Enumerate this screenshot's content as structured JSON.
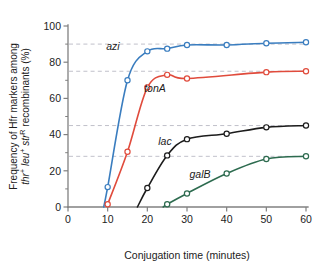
{
  "figure": {
    "background_color": "#ffffff",
    "plot_area": {
      "left": 68,
      "right": 306,
      "top": 26,
      "bottom": 207
    }
  },
  "axes": {
    "x": {
      "title": "Conjugation time (minutes)",
      "ticks": [
        "0",
        "10",
        "20",
        "30",
        "40",
        "50",
        "60"
      ],
      "tick_values": [
        0,
        10,
        20,
        30,
        40,
        50,
        60
      ],
      "min": 0,
      "max": 60
    },
    "y": {
      "title_line1": "Frequency of Hfr markers among",
      "title_line2_parts": [
        {
          "text": "thr",
          "italic": true
        },
        {
          "text": "+",
          "sup": true
        },
        {
          "text": " leu",
          "italic": true
        },
        {
          "text": "+",
          "sup": true
        },
        {
          "text": " str",
          "italic": true
        },
        {
          "text": "R",
          "sup": true
        },
        {
          "text": " recombinants (%)",
          "italic": false
        }
      ],
      "ticks": [
        "0",
        "20",
        "40",
        "60",
        "80",
        "100"
      ],
      "tick_values": [
        0,
        20,
        40,
        60,
        80,
        100
      ],
      "minor_tick_values": [
        10,
        30,
        50,
        70,
        90
      ],
      "min": 0,
      "max": 100
    }
  },
  "gridlines": {
    "values": [
      90,
      75,
      45,
      28
    ],
    "color": "#b9b9c4",
    "style": "dashed"
  },
  "series_labels": [
    {
      "name": "azi-label",
      "text": "azi",
      "x": 113,
      "y": 50,
      "color": "#1c1c1c"
    },
    {
      "name": "tonA-label",
      "text": "tonA",
      "x": 155,
      "y": 92,
      "color": "#1c1c1c"
    },
    {
      "name": "lac-label",
      "text": "lac",
      "x": 165,
      "y": 145,
      "color": "#1c1c1c"
    },
    {
      "name": "galB-label",
      "text": "galB",
      "x": 200,
      "y": 178,
      "color": "#1c1c1c"
    }
  ],
  "chart_data": {
    "type": "line",
    "title": "",
    "subtitle": "",
    "xlabel": "Conjugation time (minutes)",
    "ylabel": "Frequency of Hfr markers among thr+ leu+ strR recombinants (%)",
    "xlim": [
      0,
      60
    ],
    "ylim": [
      0,
      100
    ],
    "grid": true,
    "grid_values": [
      90,
      75,
      45,
      28
    ],
    "legend_position": "inline-labels",
    "marker": "open-circle",
    "series": [
      {
        "name": "azi",
        "color": "#3a7dbf",
        "entry_time": 9,
        "plateau": 90,
        "x": [
          9,
          10,
          15,
          20,
          25,
          30,
          40,
          50,
          60
        ],
        "y": [
          0,
          11,
          70,
          86,
          87.5,
          89.5,
          89.5,
          90.5,
          91
        ]
      },
      {
        "name": "tonA",
        "color": "#e04b3c",
        "entry_time": 10,
        "plateau": 75,
        "x": [
          10,
          15,
          20,
          25,
          30,
          50,
          60
        ],
        "y": [
          1.5,
          30.5,
          66,
          73,
          71,
          74.5,
          75
        ]
      },
      {
        "name": "lac",
        "color": "#1c1c1c",
        "entry_time": 17.5,
        "plateau": 45,
        "x": [
          17.5,
          20,
          25,
          30,
          40,
          50,
          60
        ],
        "y": [
          0,
          10.5,
          28.5,
          37.5,
          40.5,
          44,
          45
        ]
      },
      {
        "name": "galB",
        "color": "#2d6b4f",
        "entry_time": 24,
        "plateau": 28,
        "x": [
          24,
          25,
          30,
          40,
          50,
          60
        ],
        "y": [
          0,
          1.5,
          7.5,
          18.5,
          26.5,
          28
        ]
      }
    ]
  }
}
